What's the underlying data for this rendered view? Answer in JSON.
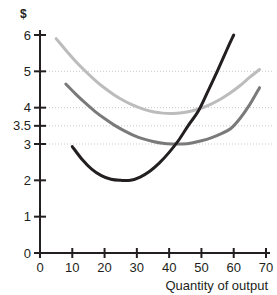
{
  "chart_data": {
    "type": "line",
    "title": "",
    "subtitle": "",
    "xlabel": "Quantity of output",
    "ylabel": "$",
    "xlim": [
      0,
      70
    ],
    "ylim": [
      0,
      6
    ],
    "xticks": [
      0,
      10,
      20,
      30,
      40,
      50,
      60,
      70
    ],
    "xtick_labels": [
      "0",
      "10",
      "20",
      "30",
      "40",
      "50",
      "60",
      "70"
    ],
    "yticks": [
      0,
      1,
      2,
      3,
      3.5,
      4,
      5,
      6
    ],
    "ytick_labels": [
      "0",
      "1",
      "2",
      "3",
      "3.5",
      "4",
      "5",
      "6"
    ],
    "gridlines": {
      "horizontal_values": [
        3,
        3.5,
        4,
        5
      ],
      "style": "dotted",
      "color": "#c9c9c9",
      "vertical": false
    },
    "legend": {
      "visible": false,
      "position": "none",
      "entries": []
    },
    "annotations": [
      {
        "label": "",
        "x": 50,
        "y": 4,
        "note": "black curve passes through light-gray curve minimum"
      },
      {
        "label": "",
        "x": 44,
        "y": 3,
        "note": "black curve passes through medium-gray curve minimum"
      }
    ],
    "series": [
      {
        "name": "average-total-cost",
        "color": "#bcbcbc",
        "width": 3,
        "shape": "u-curve",
        "minimum": {
          "x": 50,
          "y": 4.0
        },
        "x": [
          5,
          8,
          11,
          14,
          17,
          20,
          23,
          26,
          29,
          32,
          35,
          38,
          41,
          44,
          47,
          50,
          53,
          56,
          59,
          62,
          65,
          68
        ],
        "values": [
          5.9,
          5.58,
          5.28,
          5.01,
          4.76,
          4.54,
          4.35,
          4.19,
          4.06,
          3.96,
          3.89,
          3.85,
          3.84,
          3.86,
          3.91,
          3.99,
          4.1,
          4.24,
          4.41,
          4.61,
          4.84,
          5.05
        ]
      },
      {
        "name": "average-variable-cost",
        "color": "#7a7a7a",
        "width": 3,
        "shape": "u-curve",
        "minimum": {
          "x": 44,
          "y": 3.0
        },
        "x": [
          8,
          11,
          14,
          17,
          20,
          23,
          26,
          29,
          32,
          35,
          38,
          41,
          44,
          47,
          50,
          53,
          56,
          59,
          62,
          65,
          68
        ],
        "values": [
          4.65,
          4.38,
          4.13,
          3.9,
          3.7,
          3.52,
          3.37,
          3.24,
          3.14,
          3.07,
          3.02,
          3.0,
          3.0,
          3.03,
          3.09,
          3.17,
          3.28,
          3.42,
          3.71,
          4.09,
          4.55
        ]
      },
      {
        "name": "marginal-cost",
        "color": "#231f20",
        "width": 3,
        "shape": "u-curve",
        "minimum": {
          "x": 27,
          "y": 2.0
        },
        "x": [
          10,
          13,
          16,
          19,
          22,
          25,
          28,
          31,
          34,
          37,
          40,
          43,
          46,
          49,
          52,
          55,
          58,
          60
        ],
        "values": [
          2.93,
          2.58,
          2.31,
          2.13,
          2.03,
          2.0,
          2.0,
          2.09,
          2.25,
          2.48,
          2.77,
          3.11,
          3.52,
          3.9,
          4.45,
          5.02,
          5.62,
          6.0
        ]
      }
    ]
  },
  "axes": {
    "y_axis_label": "$",
    "x_axis_label": "Quantity of output"
  }
}
